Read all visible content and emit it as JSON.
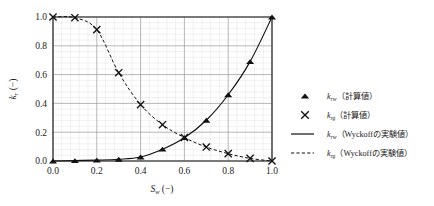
{
  "chart_data": {
    "type": "line",
    "title": "",
    "xlabel": "S_w (-)",
    "xlabel_symbol": "S",
    "xlabel_sub": "w",
    "xlabel_unit": "(−)",
    "ylabel": "k_r (-)",
    "ylabel_symbol": "k",
    "ylabel_sub": "r",
    "ylabel_unit": "(−)",
    "xlim": [
      0.0,
      1.0
    ],
    "ylim": [
      0.0,
      1.0
    ],
    "xticks": [
      "0.0",
      "0.2",
      "0.4",
      "0.6",
      "0.8",
      "1.0"
    ],
    "xtick_values": [
      0.0,
      0.2,
      0.4,
      0.6,
      0.8,
      1.0
    ],
    "yticks": [
      "0.0",
      "0.2",
      "0.4",
      "0.6",
      "0.8",
      "1.0"
    ],
    "ytick_values": [
      0.0,
      0.2,
      0.4,
      0.6,
      0.8,
      1.0
    ],
    "grid": true,
    "grid_minor": true,
    "minor_divisions": 5,
    "legend_position": "right",
    "series": [
      {
        "name": "krw_calc",
        "label_symbol": "k",
        "label_sub": "rw",
        "label_rest": "（計算値）",
        "marker": "triangle",
        "line": "none",
        "x": [
          0.0,
          0.1,
          0.2,
          0.3,
          0.4,
          0.5,
          0.6,
          0.7,
          0.8,
          0.9,
          1.0
        ],
        "values": [
          0.0,
          0.003,
          0.006,
          0.012,
          0.028,
          0.082,
          0.162,
          0.283,
          0.46,
          0.69,
          1.0
        ]
      },
      {
        "name": "krg_calc",
        "label_symbol": "k",
        "label_sub": "rg",
        "label_rest": "（計算値）",
        "marker": "x",
        "line": "none",
        "x": [
          0.0,
          0.1,
          0.2,
          0.3,
          0.4,
          0.5,
          0.6,
          0.7,
          0.8,
          0.9,
          1.0
        ],
        "values": [
          1.0,
          0.995,
          0.912,
          0.613,
          0.392,
          0.252,
          0.163,
          0.097,
          0.051,
          0.018,
          0.0
        ]
      },
      {
        "name": "krw_wyckoff",
        "label_symbol": "k",
        "label_sub": "rw",
        "label_rest": "（Wyckoffの実験値）",
        "marker": "none",
        "line": "solid",
        "x": [
          0.0,
          0.1,
          0.2,
          0.3,
          0.4,
          0.5,
          0.6,
          0.7,
          0.8,
          0.9,
          1.0
        ],
        "values": [
          0.0,
          0.003,
          0.006,
          0.012,
          0.028,
          0.082,
          0.162,
          0.283,
          0.46,
          0.69,
          1.0
        ]
      },
      {
        "name": "krg_wyckoff",
        "label_symbol": "k",
        "label_sub": "rg",
        "label_rest": "（Wyckoffの実験値）",
        "marker": "none",
        "line": "dashed",
        "x": [
          0.0,
          0.1,
          0.2,
          0.3,
          0.4,
          0.5,
          0.6,
          0.7,
          0.8,
          0.9,
          1.0
        ],
        "values": [
          1.0,
          0.995,
          0.912,
          0.613,
          0.392,
          0.252,
          0.163,
          0.097,
          0.051,
          0.018,
          0.0
        ]
      }
    ]
  },
  "legend": {
    "entries": [
      {
        "glyph": "triangle-marker",
        "symbol": "k",
        "sub": "rw",
        "rest": "（計算値）"
      },
      {
        "glyph": "x-marker",
        "symbol": "k",
        "sub": "rg",
        "rest": "（計算値）"
      },
      {
        "glyph": "solid-line",
        "symbol": "k",
        "sub": "rw",
        "rest": "（Wyckoffの実験値）"
      },
      {
        "glyph": "dashed-line",
        "symbol": "k",
        "sub": "rg",
        "rest": "（Wyckoffの実験値）"
      }
    ]
  },
  "colors": {
    "foreground": "#111111",
    "axis": "#4c4c4c",
    "grid_major": "#9a9a9a",
    "grid_minor": "#e4e2e2",
    "background": "#ffffff"
  }
}
